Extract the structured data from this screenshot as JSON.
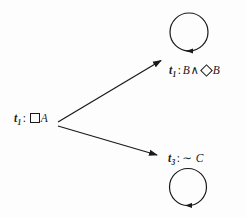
{
  "diagram": {
    "type": "modal-tableau-graph",
    "background_color": "#fdfdfd",
    "stroke_color": "#1a1a1a",
    "nodes": [
      {
        "id": "root",
        "name": "root-node",
        "label_text": "t1 : □A",
        "term": "t",
        "subscript": "1",
        "separator": ":",
        "operator": "box",
        "proposition": "A",
        "x": 14,
        "y": 112,
        "has_self_loop": false
      },
      {
        "id": "top",
        "name": "top-node",
        "label_text": "t1 : B ∧ ◇B",
        "term": "t",
        "subscript": "1",
        "separator": ":",
        "proposition_left": "B",
        "connective": "∧",
        "operator": "diamond",
        "proposition_right": "B",
        "x": 169,
        "y": 63,
        "has_self_loop": true,
        "circle": {
          "cx": 189,
          "cy": 32,
          "r": 19
        }
      },
      {
        "id": "bottom",
        "name": "bottom-node",
        "label_text": "t3 :∼ C",
        "term": "t",
        "subscript": "3",
        "separator": ":",
        "negation": "∼",
        "proposition": "C",
        "x": 168,
        "y": 151,
        "has_self_loop": true,
        "circle": {
          "cx": 188,
          "cy": 187,
          "r": 18.5
        }
      }
    ],
    "edges": [
      {
        "id": "edge-root-top",
        "name": "arrow-root-to-top",
        "from": "root",
        "to": "top",
        "x1": 58,
        "y1": 122,
        "x2": 162,
        "y2": 60
      },
      {
        "id": "edge-root-bottom",
        "name": "arrow-root-to-bottom",
        "from": "root",
        "to": "bottom",
        "x1": 58,
        "y1": 126,
        "x2": 158,
        "y2": 155
      }
    ],
    "self_loops": [
      {
        "id": "loop-top",
        "name": "self-loop-top",
        "node": "top",
        "arrow_position": "bottom",
        "arrow_direction": "left"
      },
      {
        "id": "loop-bottom",
        "name": "self-loop-bottom",
        "node": "bottom",
        "arrow_position": "bottom",
        "arrow_direction": "left"
      }
    ]
  }
}
